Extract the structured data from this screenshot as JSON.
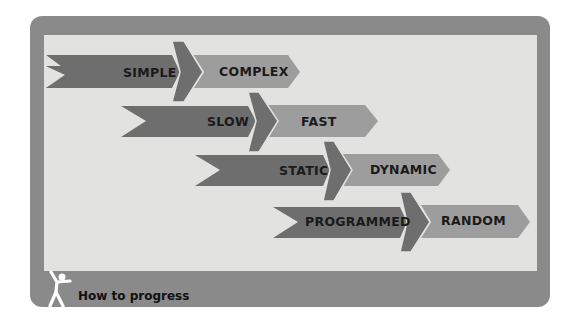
{
  "diagram": {
    "rows": [
      {
        "from": "SIMPLE",
        "to": "COMPLEX"
      },
      {
        "from": "SLOW",
        "to": "FAST"
      },
      {
        "from": "STATIC",
        "to": "DYNAMIC"
      },
      {
        "from": "PROGRAMMED",
        "to": "RANDOM"
      }
    ]
  },
  "footer": {
    "icon": "person-jumping-icon",
    "label": "How to progress"
  },
  "colors": {
    "frame": "#8a8a8a",
    "panel": "#e2e2e0",
    "dark_arrow": "#6e6e6e",
    "light_arrow": "#9d9d9d",
    "text": "#1a1a1a"
  }
}
